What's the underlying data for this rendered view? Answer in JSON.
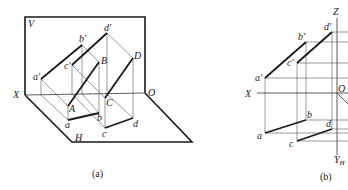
{
  "figure_a": {
    "caption": "(a)",
    "planes": {
      "vertical": "V",
      "horizontal": "H"
    },
    "axis_labels": {
      "x": "X",
      "origin": "O"
    },
    "space_points": {
      "A": "A",
      "B": "B",
      "C": "C",
      "D": "D"
    },
    "front_projections": {
      "a": "a′",
      "b": "b′",
      "c": "c′",
      "d": "d′"
    },
    "top_projections": {
      "a": "a",
      "b": "b",
      "c": "c",
      "d": "d"
    }
  },
  "figure_b": {
    "caption": "(b)",
    "axis_labels": {
      "x": "X",
      "z": "Z",
      "origin": "O",
      "yh": "Y",
      "yh_sub": "H"
    },
    "front_projections": {
      "a": "a′",
      "b": "b′",
      "c": "c′",
      "d": "d′"
    },
    "top_projections": {
      "a": "a",
      "b": "b",
      "c": "c",
      "d": "d"
    }
  }
}
